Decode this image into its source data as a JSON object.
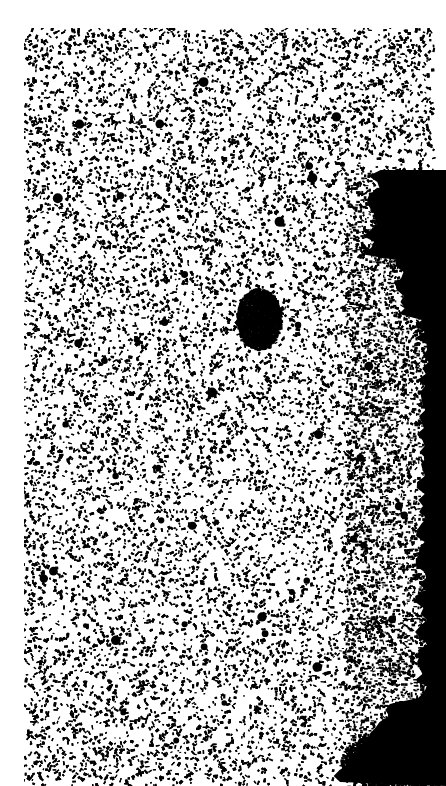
{
  "image": {
    "kind": "high-contrast black-and-white speckle texture (micrograph-like)",
    "width": 446,
    "height": 786,
    "background_color": "#ffffff",
    "ink_color": "#000000",
    "texture_region": {
      "x": 24,
      "y": 28,
      "w": 410,
      "h": 758
    },
    "dark_masses": [
      {
        "name": "right-edge-mass",
        "shape": "band",
        "x_from": 360,
        "y_from": 170,
        "y_to": 786
      },
      {
        "name": "center-blob",
        "cx": 258,
        "cy": 318,
        "rx": 22,
        "ry": 30
      },
      {
        "name": "bottom-right-mass",
        "cx": 400,
        "cy": 760,
        "rx": 60,
        "ry": 30
      }
    ]
  }
}
